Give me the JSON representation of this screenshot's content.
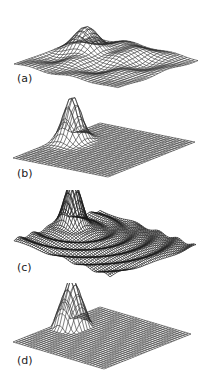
{
  "figure": {
    "panels": [
      {
        "id": "a",
        "label": "(a)",
        "description": "3D wireframe surface with broad peak and ripples",
        "peak": [
          88,
          22
        ]
      },
      {
        "id": "b",
        "label": "(b)",
        "description": "3D wireframe surface with single smooth peak",
        "peak": [
          78,
          107
        ]
      },
      {
        "id": "c",
        "label": "(c)",
        "description": "3D wireframe surface with peak on dense dark mesh",
        "peak": [
          79,
          193
        ]
      },
      {
        "id": "d",
        "label": "(d)",
        "description": "3D wireframe surface with sharp conical peak",
        "peak": [
          78,
          286
        ]
      }
    ],
    "colors": {
      "mesh": "#2a2a2a",
      "mesh_dense": "#1a1a1a",
      "background": "#ffffff"
    }
  }
}
